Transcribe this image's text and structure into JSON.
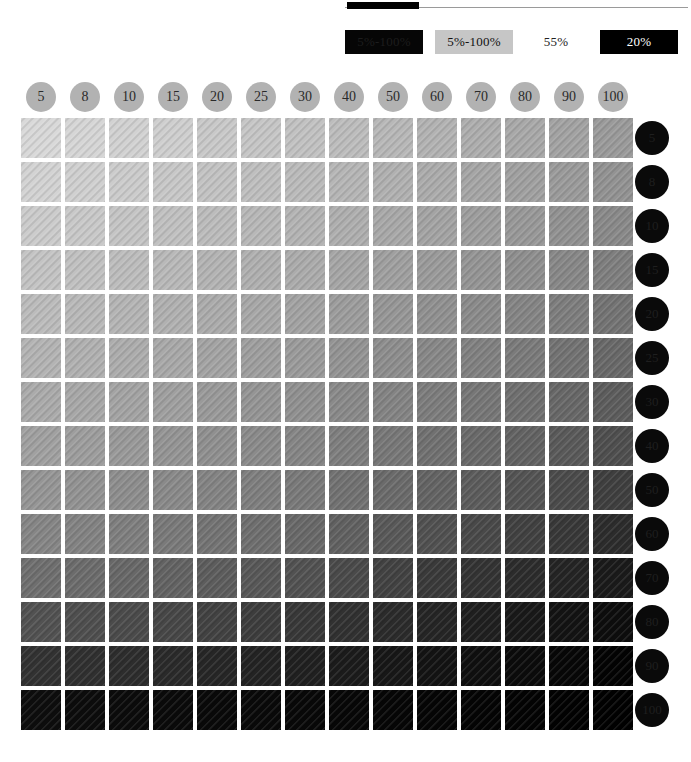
{
  "top_rule": {
    "swatch_label": "",
    "swatch_color": "#000000",
    "line_color": "#9a9a9a"
  },
  "legend": {
    "items": [
      {
        "label": "5%-100%",
        "bg": "#060606",
        "fg": "#1d1d1d",
        "name": "legend-swatch-black"
      },
      {
        "label": "5%-100%",
        "bg": "#c6c6c6",
        "fg": "#111111",
        "name": "legend-swatch-gray"
      },
      {
        "label": "55%",
        "bg": "transparent",
        "fg": "#222222",
        "name": "legend-label-55"
      },
      {
        "label": "20%",
        "bg": "#000000",
        "fg": "#ffffff",
        "name": "legend-swatch-20"
      }
    ]
  },
  "grid": {
    "column_headers": [
      "5",
      "8",
      "10",
      "15",
      "20",
      "25",
      "30",
      "40",
      "50",
      "60",
      "70",
      "80",
      "90",
      "100"
    ],
    "row_headers": [
      "5",
      "8",
      "10",
      "15",
      "20",
      "25",
      "30",
      "40",
      "50",
      "60",
      "70",
      "80",
      "90",
      "100"
    ],
    "column_header_bg": "#b2b2b2",
    "row_header_bg": "#0a0a0a",
    "cell_size": 40,
    "cell_pitch": 44,
    "origin_x": 21,
    "origin_y": 118
  },
  "chart_data": {
    "type": "heatmap",
    "xlabel": "Screen ruling / tint % (columns)",
    "ylabel": "Tint % (rows)",
    "x": [
      "5",
      "8",
      "10",
      "15",
      "20",
      "25",
      "30",
      "40",
      "50",
      "60",
      "70",
      "80",
      "90",
      "100"
    ],
    "y": [
      "5",
      "8",
      "10",
      "15",
      "20",
      "25",
      "30",
      "40",
      "50",
      "60",
      "70",
      "80",
      "90",
      "100"
    ],
    "legend": [
      "5%-100%",
      "5%-100%",
      "55%",
      "20%"
    ],
    "colormap": "grayscale-descending",
    "value_note": "Each cell is a gray patch; lightness decreases left-to-right and top-to-bottom.",
    "values": [
      [
        "#d9d9d9",
        "#d6d6d6",
        "#d2d2d2",
        "#cfcfcf",
        "#c9c9c9",
        "#c6c6c6",
        "#c2c2c2",
        "#bdbdbd",
        "#b8b8b8",
        "#b3b3b3",
        "#aeaeae",
        "#a9a9a9",
        "#a3a3a3",
        "#9b9b9b"
      ],
      [
        "#d3d3d3",
        "#d0d0d0",
        "#cccccc",
        "#c8c8c8",
        "#c3c3c3",
        "#bfbfbf",
        "#bbbbbb",
        "#b6b6b6",
        "#b1b1b1",
        "#acacac",
        "#a6a6a6",
        "#a1a1a1",
        "#9b9b9b",
        "#939393"
      ],
      [
        "#cccccc",
        "#c9c9c9",
        "#c5c5c5",
        "#c1c1c1",
        "#bcbcbc",
        "#b8b8b8",
        "#b4b4b4",
        "#afafaf",
        "#a9a9a9",
        "#a4a4a4",
        "#9e9e9e",
        "#999999",
        "#929292",
        "#8a8a8a"
      ],
      [
        "#c4c4c4",
        "#c1c1c1",
        "#bdbdbd",
        "#b9b9b9",
        "#b4b4b4",
        "#b0b0b0",
        "#acacac",
        "#a6a6a6",
        "#a0a0a0",
        "#9b9b9b",
        "#959595",
        "#8f8f8f",
        "#888888",
        "#7f7f7f"
      ],
      [
        "#bcbcbc",
        "#b9b9b9",
        "#b5b5b5",
        "#b1b1b1",
        "#acacac",
        "#a8a8a8",
        "#a3a3a3",
        "#9d9d9d",
        "#979797",
        "#919191",
        "#8b8b8b",
        "#858585",
        "#7e7e7e",
        "#747474"
      ],
      [
        "#b4b4b4",
        "#b1b1b1",
        "#adadad",
        "#a9a9a9",
        "#a4a4a4",
        "#9f9f9f",
        "#9b9b9b",
        "#949494",
        "#8e8e8e",
        "#888888",
        "#818181",
        "#7b7b7b",
        "#737373",
        "#696969"
      ],
      [
        "#ababab",
        "#a8a8a8",
        "#a4a4a4",
        "#a0a0a0",
        "#9a9a9a",
        "#959595",
        "#919191",
        "#8a8a8a",
        "#848484",
        "#7d7d7d",
        "#777777",
        "#707070",
        "#686868",
        "#5d5d5d"
      ],
      [
        "#a1a1a1",
        "#9e9e9e",
        "#9a9a9a",
        "#959595",
        "#909090",
        "#8b8b8b",
        "#868686",
        "#7f7f7f",
        "#787878",
        "#717171",
        "#6a6a6a",
        "#636363",
        "#5a5a5a",
        "#4f4f4f"
      ],
      [
        "#969696",
        "#939393",
        "#8e8e8e",
        "#8a8a8a",
        "#848484",
        "#7f7f7f",
        "#7a7a7a",
        "#727272",
        "#6b6b6b",
        "#646464",
        "#5c5c5c",
        "#545454",
        "#4b4b4b",
        "#3f3f3f"
      ],
      [
        "#868686",
        "#838383",
        "#7f7f7f",
        "#7a7a7a",
        "#747474",
        "#6f6f6f",
        "#696969",
        "#616161",
        "#595959",
        "#515151",
        "#494949",
        "#414141",
        "#383838",
        "#2c2c2c"
      ],
      [
        "#6f6f6f",
        "#6c6c6c",
        "#686868",
        "#636363",
        "#5d5d5d",
        "#585858",
        "#525252",
        "#4a4a4a",
        "#424242",
        "#3a3a3a",
        "#333333",
        "#2c2c2c",
        "#242424",
        "#1a1a1a"
      ],
      [
        "#525252",
        "#4f4f4f",
        "#4b4b4b",
        "#474747",
        "#424242",
        "#3d3d3d",
        "#383838",
        "#313131",
        "#2b2b2b",
        "#252525",
        "#1f1f1f",
        "#191919",
        "#131313",
        "#0d0d0d"
      ],
      [
        "#323232",
        "#303030",
        "#2d2d2d",
        "#2a2a2a",
        "#262626",
        "#232323",
        "#202020",
        "#1b1b1b",
        "#171717",
        "#131313",
        "#0f0f0f",
        "#0b0b0b",
        "#070707",
        "#030303"
      ],
      [
        "#0d0d0d",
        "#0c0c0c",
        "#0b0b0b",
        "#0a0a0a",
        "#090909",
        "#090909",
        "#080808",
        "#070707",
        "#060606",
        "#050505",
        "#040404",
        "#030303",
        "#020202",
        "#010101"
      ]
    ]
  }
}
